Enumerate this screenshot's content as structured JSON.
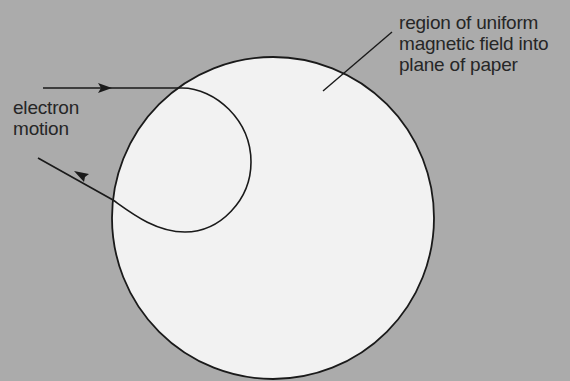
{
  "diagram": {
    "colors": {
      "background": "#ababab",
      "field_region": "#f2f2f2",
      "stroke": "#1a1a1a",
      "text": "#262626"
    },
    "field_region": {
      "shape": "circle",
      "center": [
        273,
        218
      ],
      "radius": 161,
      "label_lines": [
        "region of uniform",
        "magnetic field into",
        "plane of paper"
      ],
      "label": "region of uniform\nmagnetic field into\nplane of paper"
    },
    "electron_path": {
      "label_lines": [
        "electron",
        "motion"
      ],
      "label": "electron\nmotion",
      "direction": "enters from left moving right, curves clockwise inside field, exits up-left"
    }
  }
}
